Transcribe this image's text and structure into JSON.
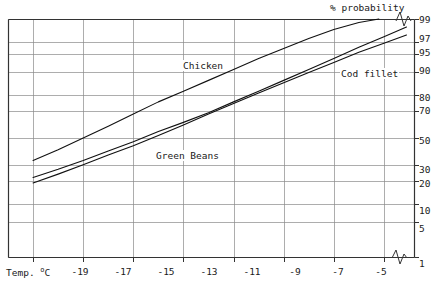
{
  "chart_data": {
    "type": "line",
    "title": "",
    "ylabel": "% probability",
    "xlabel": "Temp. ºC",
    "xlabel_prefix": "Temp. ",
    "xlabel_unit": "o",
    "xlabel_unit_suffix": "C",
    "y_scale": "probability",
    "x_ticks": [
      -19,
      -17,
      -15,
      -13,
      -11,
      -9,
      -7,
      -5
    ],
    "x_tick_labels": [
      "-19",
      "-17",
      "-15",
      "-13",
      "-11",
      "-9",
      "-7",
      "-5"
    ],
    "y_ticks": [
      99,
      97,
      95,
      90,
      80,
      70,
      50,
      30,
      20,
      10,
      5,
      1
    ],
    "y_tick_labels": [
      "99",
      "97",
      "95",
      "90",
      "80",
      "70",
      "50",
      "30",
      "20",
      "10",
      "5",
      "1"
    ],
    "xlim": [
      -20,
      -3.8
    ],
    "ylim": [
      1,
      99
    ],
    "grid": true,
    "legend_position": "inline-annotations",
    "axis_break_x": true,
    "axis_break_y": true,
    "series": [
      {
        "name": "Chicken",
        "color": "#111111",
        "label_position": "upper-middle",
        "points": [
          {
            "x": -19.0,
            "y": 33
          },
          {
            "x": -18.0,
            "y": 41
          },
          {
            "x": -17.0,
            "y": 50
          },
          {
            "x": -16.0,
            "y": 59
          },
          {
            "x": -15.0,
            "y": 68
          },
          {
            "x": -14.0,
            "y": 76
          },
          {
            "x": -13.0,
            "y": 82
          },
          {
            "x": -12.0,
            "y": 87
          },
          {
            "x": -11.0,
            "y": 91
          },
          {
            "x": -10.0,
            "y": 94
          },
          {
            "x": -9.0,
            "y": 96
          },
          {
            "x": -8.0,
            "y": 97.4
          },
          {
            "x": -7.0,
            "y": 98.3
          },
          {
            "x": -6.0,
            "y": 98.8
          },
          {
            "x": -5.2,
            "y": 99.0
          }
        ]
      },
      {
        "name": "Cod fillet",
        "color": "#111111",
        "label_position": "right-upper",
        "points": [
          {
            "x": -19.0,
            "y": 22
          },
          {
            "x": -18.0,
            "y": 27
          },
          {
            "x": -17.0,
            "y": 33
          },
          {
            "x": -16.0,
            "y": 40
          },
          {
            "x": -15.0,
            "y": 47
          },
          {
            "x": -14.0,
            "y": 55
          },
          {
            "x": -13.0,
            "y": 62
          },
          {
            "x": -12.0,
            "y": 69
          },
          {
            "x": -11.0,
            "y": 76
          },
          {
            "x": -10.0,
            "y": 82
          },
          {
            "x": -9.0,
            "y": 87
          },
          {
            "x": -8.0,
            "y": 91
          },
          {
            "x": -7.0,
            "y": 94
          },
          {
            "x": -6.0,
            "y": 96.2
          },
          {
            "x": -5.0,
            "y": 97.6
          },
          {
            "x": -4.1,
            "y": 98.5
          }
        ]
      },
      {
        "name": "Green Beans",
        "color": "#111111",
        "label_position": "lower-middle",
        "points": [
          {
            "x": -19.0,
            "y": 19
          },
          {
            "x": -18.0,
            "y": 24
          },
          {
            "x": -17.0,
            "y": 30
          },
          {
            "x": -16.0,
            "y": 37
          },
          {
            "x": -15.0,
            "y": 44
          },
          {
            "x": -14.0,
            "y": 52
          },
          {
            "x": -13.0,
            "y": 60
          },
          {
            "x": -12.0,
            "y": 68
          },
          {
            "x": -11.0,
            "y": 75
          },
          {
            "x": -10.0,
            "y": 81
          },
          {
            "x": -9.0,
            "y": 86
          },
          {
            "x": -8.0,
            "y": 90
          },
          {
            "x": -7.0,
            "y": 93
          },
          {
            "x": -6.0,
            "y": 95.3
          },
          {
            "x": -5.0,
            "y": 96.8
          },
          {
            "x": -4.1,
            "y": 97.8
          }
        ]
      }
    ]
  },
  "labels": {
    "y_axis_title": "% probability",
    "x_axis_title": "Temp. ",
    "x_axis_unit": "o",
    "x_axis_unit_c": "C",
    "chicken": "Chicken",
    "cod_fillet": "Cod fillet",
    "green_beans": "Green Beans"
  },
  "y_tick_labels": {
    "t99": "99",
    "t97": "97",
    "t95": "95",
    "t90": "90",
    "t80": "80",
    "t70": "70",
    "t50": "50",
    "t30": "30",
    "t20": "20",
    "t10": "10",
    "t5": "5",
    "t1": "1"
  },
  "x_tick_labels": {
    "t19": "-19",
    "t17": "-17",
    "t15": "-15",
    "t13": "-13",
    "t11": "-11",
    "t9": "-9",
    "t7": "-7",
    "t5": "-5"
  }
}
